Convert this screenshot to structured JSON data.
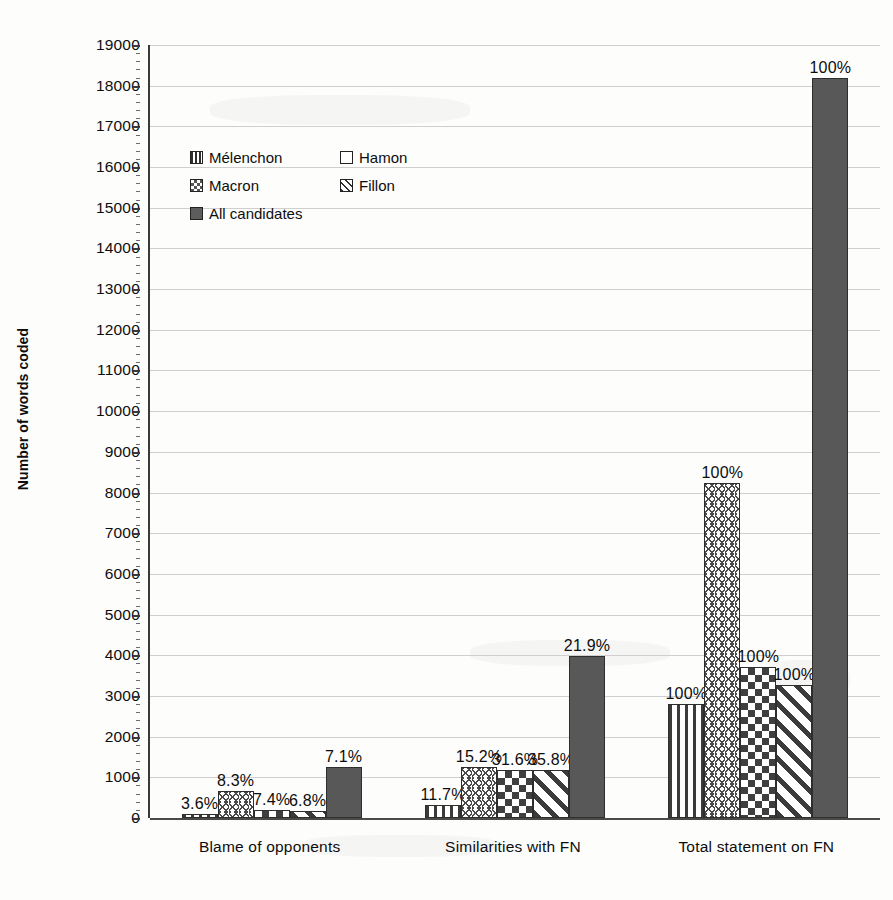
{
  "chart_data": {
    "type": "bar",
    "title": "",
    "xlabel": "",
    "ylabel": "Number of words coded",
    "ylim": [
      0,
      19000
    ],
    "ytick_step": 1000,
    "ytick_labels": [
      "19000",
      "18000",
      "17000",
      "16000",
      "15000",
      "14000",
      "13000",
      "12000",
      "11000",
      "10000",
      "9000",
      "8000",
      "7000",
      "6000",
      "5000",
      "4000",
      "3000",
      "2000",
      "1000",
      "0"
    ],
    "grid": true,
    "legend_position": "upper-left-inside",
    "categories": [
      "Blame of opponents",
      "Similarities with FN",
      "Total statement on FN"
    ],
    "series": [
      {
        "name": "Mélenchon",
        "pattern": "vertical-stripes",
        "values": [
          100,
          325,
          2800
        ],
        "labels": [
          "3.6%",
          "11.7%",
          "100%"
        ]
      },
      {
        "name": "Hamon",
        "pattern": "zigzag",
        "values": [
          670,
          1250,
          8230
        ],
        "labels": [
          "8.3%",
          "15.2%",
          "100%"
        ]
      },
      {
        "name": "Macron",
        "pattern": "checkerboard",
        "values": [
          200,
          1170,
          3700
        ],
        "labels": [
          "7.4%",
          "31.6%",
          "100%"
        ]
      },
      {
        "name": "Fillon",
        "pattern": "diagonal-stripes",
        "values": [
          180,
          1170,
          3280
        ],
        "labels": [
          "6.8%",
          "35.8%",
          "100%"
        ]
      },
      {
        "name": "All candidates",
        "pattern": "solid-dark",
        "values": [
          1250,
          3990,
          18200
        ],
        "labels": [
          "7.1%",
          "21.9%",
          "100%"
        ]
      }
    ],
    "colors": {
      "series_ink": "#3b3b3b",
      "all_candidates_fill": "#585858",
      "gridline": "#cfcfcf",
      "axis": "#3a3a3a",
      "background": "#fdfdfc",
      "text": "#0d0d0d"
    }
  }
}
